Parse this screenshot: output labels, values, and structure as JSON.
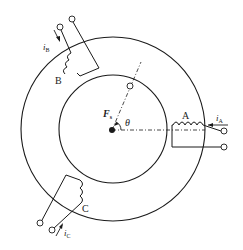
{
  "diagram": {
    "labels": {
      "winding_a": "A",
      "winding_b": "B",
      "winding_c": "C",
      "current_a": "i",
      "current_a_sub": "A",
      "current_b": "i",
      "current_b_sub": "B",
      "current_c": "i",
      "current_c_sub": "C",
      "mmf": "F",
      "mmf_sub": "s",
      "angle": "θ"
    },
    "colors": {
      "stroke": "#1a1a1a",
      "background": "#ffffff"
    }
  }
}
